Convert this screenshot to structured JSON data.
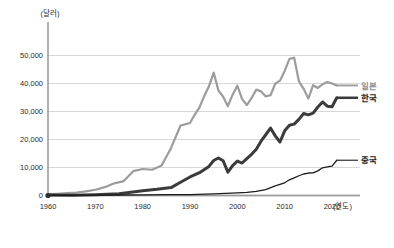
{
  "chart_data": {
    "type": "line",
    "title": "",
    "xlabel": "(연도)",
    "ylabel": "(달러)",
    "xlim": [
      1960,
      2022
    ],
    "ylim": [
      0,
      55000
    ],
    "grid": true,
    "legend_position": "right-inline",
    "x_ticks": [
      1960,
      1970,
      1980,
      1990,
      2000,
      2010,
      2020
    ],
    "x_tick_labels": [
      "1960",
      "1970",
      "1980",
      "1990",
      "2000",
      "2010",
      "2020"
    ],
    "y_ticks": [
      0,
      10000,
      20000,
      30000,
      40000,
      50000
    ],
    "y_tick_labels": [
      "0",
      "10,000",
      "20,000",
      "30,000",
      "40,000",
      "50,000"
    ],
    "series": [
      {
        "name": "일본",
        "color": "#9c9c9c",
        "width": 2.2,
        "label_color": "#8e8e8e",
        "x": [
          1960,
          1962,
          1964,
          1966,
          1968,
          1970,
          1972,
          1974,
          1976,
          1978,
          1980,
          1982,
          1984,
          1986,
          1988,
          1990,
          1991,
          1992,
          1993,
          1994,
          1995,
          1996,
          1997,
          1998,
          1999,
          2000,
          2001,
          2002,
          2003,
          2004,
          2005,
          2006,
          2007,
          2008,
          2009,
          2010,
          2011,
          2012,
          2013,
          2014,
          2015,
          2016,
          2017,
          2018,
          2019,
          2020,
          2021
        ],
        "values": [
          479,
          633,
          835,
          1059,
          1450,
          2040,
          2970,
          4340,
          5150,
          8700,
          9460,
          9200,
          10700,
          17000,
          25000,
          25900,
          28900,
          31500,
          35500,
          39000,
          43900,
          37500,
          35300,
          31900,
          36000,
          39200,
          34400,
          32300,
          34800,
          37800,
          37200,
          35400,
          35800,
          39900,
          41000,
          44500,
          48800,
          49200,
          40800,
          38100,
          34600,
          39400,
          38400,
          39700,
          40500,
          40000,
          39300
        ]
      },
      {
        "name": "한국",
        "color": "#3b3b3b",
        "width": 3.0,
        "label_color": "#1c1c1c",
        "x": [
          1960,
          1965,
          1970,
          1975,
          1980,
          1983,
          1986,
          1988,
          1990,
          1992,
          1994,
          1995,
          1996,
          1997,
          1998,
          1999,
          2000,
          2001,
          2002,
          2003,
          2004,
          2005,
          2006,
          2007,
          2008,
          2009,
          2010,
          2011,
          2012,
          2013,
          2014,
          2015,
          2016,
          2017,
          2018,
          2019,
          2020,
          2021
        ],
        "values": [
          158,
          109,
          279,
          617,
          1715,
          2200,
          2830,
          4750,
          6610,
          8130,
          10400,
          12500,
          13400,
          12400,
          8300,
          10700,
          12300,
          11600,
          13200,
          14700,
          16500,
          19400,
          21700,
          24100,
          21300,
          19100,
          23100,
          25100,
          25500,
          27200,
          29300,
          28800,
          29400,
          31600,
          33400,
          31900,
          31700,
          34900
        ]
      },
      {
        "name": "중국",
        "color": "#1c1c1c",
        "width": 1.3,
        "label_color": "#1c1c1c",
        "x": [
          1960,
          1965,
          1970,
          1975,
          1980,
          1985,
          1990,
          1995,
          2000,
          2002,
          2004,
          2006,
          2008,
          2010,
          2011,
          2012,
          2013,
          2014,
          2015,
          2016,
          2017,
          2018,
          2019,
          2020,
          2021
        ],
        "values": [
          90,
          98,
          113,
          178,
          195,
          294,
          318,
          610,
          959,
          1150,
          1500,
          2100,
          3470,
          4550,
          5600,
          6300,
          7050,
          7680,
          8030,
          8100,
          8800,
          9900,
          10200,
          10500,
          12600
        ]
      }
    ],
    "origin_marker": {
      "x": 1960,
      "y": 0
    }
  }
}
